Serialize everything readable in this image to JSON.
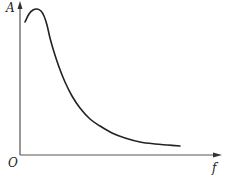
{
  "chart_data": {
    "type": "line",
    "title": "",
    "xlabel": "f",
    "ylabel": "A",
    "origin_label": "O",
    "grid": false,
    "legend": null,
    "series": [
      {
        "name": "A(f)",
        "description": "Amplitude vs frequency: rises to a peak at low f, then decays monotonically toward an asymptote",
        "points_px": [
          [
            25,
            22
          ],
          [
            29,
            14
          ],
          [
            33,
            10
          ],
          [
            37,
            9
          ],
          [
            41,
            11
          ],
          [
            44,
            16
          ],
          [
            47,
            25
          ],
          [
            50,
            38
          ],
          [
            54,
            52
          ],
          [
            59,
            67
          ],
          [
            65,
            82
          ],
          [
            72,
            96
          ],
          [
            80,
            108
          ],
          [
            90,
            119
          ],
          [
            100,
            126
          ],
          [
            112,
            133
          ],
          [
            125,
            138
          ],
          [
            140,
            142
          ],
          [
            155,
            144
          ],
          [
            168,
            145
          ],
          [
            180,
            146
          ]
        ],
        "x_rel": [
          0.02,
          0.04,
          0.065,
          0.085,
          0.105,
          0.12,
          0.135,
          0.15,
          0.17,
          0.195,
          0.225,
          0.26,
          0.3,
          0.35,
          0.4,
          0.46,
          0.525,
          0.6,
          0.675,
          0.74,
          0.8
        ],
        "y_rel": [
          0.87,
          0.92,
          0.945,
          0.95,
          0.94,
          0.91,
          0.85,
          0.77,
          0.68,
          0.58,
          0.48,
          0.39,
          0.31,
          0.24,
          0.19,
          0.15,
          0.11,
          0.085,
          0.07,
          0.065,
          0.06
        ]
      }
    ],
    "xlim": [
      0,
      1
    ],
    "ylim": [
      0,
      1
    ],
    "ticks": "none"
  },
  "colors": {
    "axis": "#555555",
    "curve": "#222222",
    "background": "#ffffff"
  }
}
